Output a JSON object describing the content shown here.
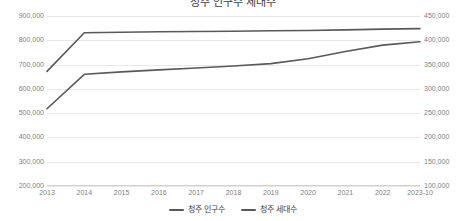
{
  "chart_data": {
    "type": "line",
    "title": "청주 인구수 세대수",
    "xlabel": "",
    "ylabel": "",
    "grid": true,
    "legend_position": "bottom",
    "x": [
      "2013",
      "2014",
      "2015",
      "2016",
      "2017",
      "2018",
      "2019",
      "2020",
      "2021",
      "2022",
      "2023-10"
    ],
    "categories": [
      "2013",
      "2014",
      "2015",
      "2016",
      "2017",
      "2018",
      "2019",
      "2020",
      "2021",
      "2022",
      "2023-10"
    ],
    "y_left_ticks": [
      "200,000",
      "300,000",
      "400,000",
      "500,000",
      "600,000",
      "700,000",
      "800,000",
      "900,000"
    ],
    "y_right_ticks": [
      "100,000",
      "150,000",
      "200,000",
      "250,000",
      "300,000",
      "350,000",
      "400,000",
      "450,000"
    ],
    "ylim": [
      200000,
      900000
    ],
    "ylim_right": [
      100000,
      450000
    ],
    "series": [
      {
        "name": "청주 인구수",
        "axis": "left",
        "color": "#595959",
        "values": [
          672000,
          831000,
          833000,
          835000,
          836000,
          837000,
          839000,
          840000,
          843000,
          846000,
          848000
        ]
      },
      {
        "name": "청주 세대수",
        "axis": "right",
        "color": "#595959",
        "values": [
          259000,
          330000,
          335000,
          339000,
          343000,
          347000,
          352000,
          362000,
          377000,
          390000,
          397000
        ]
      }
    ]
  },
  "legend": {
    "items": [
      {
        "label": "청주 인구수"
      },
      {
        "label": "청주 세대수"
      }
    ]
  }
}
